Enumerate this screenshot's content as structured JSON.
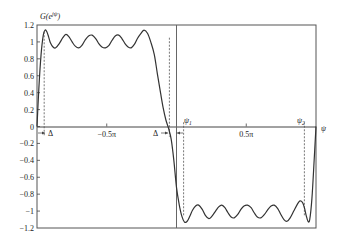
{
  "chart_data": {
    "type": "line",
    "title": "",
    "ylabel": "G(e^{jψ})",
    "xlabel": "ψ",
    "xlim": [
      -3.14159,
      3.14159
    ],
    "ylim": [
      -1.2,
      1.2
    ],
    "grid": false,
    "yticks": [
      {
        "value": 1.2,
        "label": "1.2"
      },
      {
        "value": 1.0,
        "label": "1"
      },
      {
        "value": 0.8,
        "label": "0.8"
      },
      {
        "value": 0.6,
        "label": "0.6"
      },
      {
        "value": 0.4,
        "label": "0.4"
      },
      {
        "value": 0.2,
        "label": "0.2"
      },
      {
        "value": 0.0,
        "label": "0"
      },
      {
        "value": -0.2,
        "label": "−0.2"
      },
      {
        "value": -0.4,
        "label": "−0.4"
      },
      {
        "value": -0.6,
        "label": "−0.6"
      },
      {
        "value": -0.8,
        "label": "−0.8"
      },
      {
        "value": -1.0,
        "label": "−1"
      },
      {
        "value": -1.2,
        "label": "−1.2"
      }
    ],
    "xticks": [
      {
        "value": -1.5708,
        "label": "−0.5π"
      },
      {
        "value": 1.5708,
        "label": "0.5π"
      }
    ],
    "annotations": [
      {
        "type": "vline-dashed",
        "x": -2.98,
        "label": "Δ",
        "note": "transition width at left edge"
      },
      {
        "type": "vline-dashed",
        "x": -0.16,
        "label": "Δ",
        "note": "transition width near zero"
      },
      {
        "type": "vline-dashed",
        "x": 0.16,
        "label": "ψ₁"
      },
      {
        "type": "vline-dashed",
        "x": 2.88,
        "label": "ψ₂"
      },
      {
        "type": "vline-solid",
        "x": 0.0
      }
    ],
    "series": [
      {
        "name": "G(e^{jψ})",
        "x": [
          -3.1416,
          -3.1,
          -3.05,
          -3.0,
          -2.96,
          -2.92,
          -2.88,
          -2.84,
          -2.78,
          -2.72,
          -2.64,
          -2.56,
          -2.49,
          -2.42,
          -2.35,
          -2.28,
          -2.2,
          -2.13,
          -2.06,
          -1.98,
          -1.9,
          -1.82,
          -1.75,
          -1.68,
          -1.6,
          -1.52,
          -1.45,
          -1.38,
          -1.3,
          -1.23,
          -1.16,
          -1.09,
          -1.02,
          -0.95,
          -0.88,
          -0.8,
          -0.73,
          -0.65,
          -0.58,
          -0.5,
          -0.43,
          -0.36,
          -0.3,
          -0.24,
          -0.18,
          -0.12,
          -0.06,
          0.0,
          0.06,
          0.12,
          0.18,
          0.24,
          0.3,
          0.36,
          0.43,
          0.5,
          0.58,
          0.65,
          0.73,
          0.8,
          0.88,
          0.95,
          1.02,
          1.09,
          1.16,
          1.23,
          1.3,
          1.38,
          1.45,
          1.52,
          1.6,
          1.68,
          1.75,
          1.82,
          1.9,
          1.98,
          2.06,
          2.13,
          2.2,
          2.28,
          2.35,
          2.42,
          2.49,
          2.56,
          2.64,
          2.72,
          2.78,
          2.84,
          2.88,
          2.92,
          2.96,
          3.0,
          3.05,
          3.1,
          3.1416
        ],
        "y": [
          0.0,
          0.45,
          0.85,
          1.08,
          1.14,
          1.12,
          1.06,
          0.99,
          0.94,
          0.93,
          0.98,
          1.05,
          1.09,
          1.06,
          1.0,
          0.95,
          0.93,
          0.96,
          1.02,
          1.07,
          1.08,
          1.04,
          0.98,
          0.94,
          0.93,
          0.96,
          1.02,
          1.07,
          1.08,
          1.04,
          0.98,
          0.94,
          0.93,
          0.97,
          1.04,
          1.1,
          1.14,
          1.1,
          1.0,
          0.85,
          0.62,
          0.4,
          0.22,
          0.08,
          -0.02,
          -0.15,
          -0.4,
          -0.72,
          -0.92,
          -1.06,
          -1.13,
          -1.12,
          -1.06,
          -0.99,
          -0.94,
          -0.93,
          -0.98,
          -1.05,
          -1.09,
          -1.06,
          -1.0,
          -0.95,
          -0.93,
          -0.96,
          -1.02,
          -1.07,
          -1.08,
          -1.04,
          -0.98,
          -0.94,
          -0.93,
          -0.96,
          -1.02,
          -1.07,
          -1.08,
          -1.04,
          -0.98,
          -0.94,
          -0.93,
          -0.97,
          -1.04,
          -1.1,
          -1.12,
          -1.08,
          -1.0,
          -0.92,
          -0.88,
          -0.9,
          -0.96,
          -1.05,
          -1.12,
          -1.1,
          -0.85,
          -0.4,
          0.0
        ]
      }
    ]
  },
  "labels": {
    "y_axis_title": "G(e",
    "y_axis_title_sup": "jψ",
    "y_axis_title_close": ")",
    "x_axis_title": "ψ",
    "delta_left": "Δ",
    "delta_right": "Δ",
    "psi1": "ψ",
    "psi1_sub": "1",
    "psi2": "ψ",
    "psi2_sub": "2"
  },
  "colors": {
    "curve": "#333333",
    "axis": "#444444",
    "dashed": "#555555"
  }
}
